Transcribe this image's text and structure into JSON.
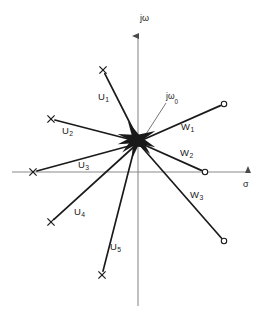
{
  "figure": {
    "width": 264,
    "height": 324,
    "background": "#ffffff",
    "ink_color": "#1a1a1a",
    "axis_color": "#8a8a8a"
  },
  "axes": {
    "origin": {
      "x": 138,
      "y": 172
    },
    "real": {
      "name": "sigma-axis",
      "label": "σ",
      "label_pos": {
        "x": 243,
        "y": 180
      },
      "x_start": 12,
      "x_end": 252,
      "y": 172,
      "arrow": "right"
    },
    "imaginary": {
      "name": "j-omega-axis",
      "label": "jω",
      "label_pos": {
        "x": 140,
        "y": 14
      },
      "y_start": 32,
      "y_end": 306,
      "x": 138,
      "arrow": "up"
    }
  },
  "annotations": [
    {
      "name": "j-omega-zero-annotation",
      "text": "jω",
      "sub": "0",
      "label_pos": {
        "x": 166,
        "y": 92
      },
      "leader_from": {
        "x": 166,
        "y": 103
      },
      "leader_to": {
        "x": 146,
        "y": 134
      }
    }
  ],
  "cluster": {
    "name": "origin-cluster",
    "center": {
      "x": 137,
      "y": 139
    },
    "description": "dense bundle of ray tails converging near the origin"
  },
  "rays": [
    {
      "name": "ray-u1",
      "label": "U",
      "sub": "1",
      "marker": "x",
      "marker_pos": {
        "x": 103,
        "y": 70
      },
      "tail": {
        "x": 140,
        "y": 143
      },
      "label_pos": {
        "x": 98,
        "y": 92
      }
    },
    {
      "name": "ray-u2",
      "label": "U",
      "sub": "2",
      "marker": "x",
      "marker_pos": {
        "x": 51,
        "y": 119
      },
      "tail": {
        "x": 140,
        "y": 142
      },
      "label_pos": {
        "x": 62,
        "y": 126
      }
    },
    {
      "name": "ray-u3",
      "label": "U",
      "sub": "3",
      "marker": "x",
      "marker_pos": {
        "x": 33,
        "y": 172
      },
      "tail": {
        "x": 140,
        "y": 143
      },
      "label_pos": {
        "x": 78,
        "y": 160
      }
    },
    {
      "name": "ray-u4",
      "label": "U",
      "sub": "4",
      "marker": "x",
      "marker_pos": {
        "x": 51,
        "y": 222
      },
      "tail": {
        "x": 138,
        "y": 143
      },
      "label_pos": {
        "x": 74,
        "y": 207
      }
    },
    {
      "name": "ray-u5",
      "label": "U",
      "sub": "5",
      "marker": "x",
      "marker_pos": {
        "x": 102,
        "y": 275
      },
      "tail": {
        "x": 136,
        "y": 142
      },
      "label_pos": {
        "x": 110,
        "y": 242
      }
    },
    {
      "name": "ray-w1",
      "label": "W",
      "sub": "1",
      "marker": "o",
      "marker_pos": {
        "x": 224,
        "y": 104
      },
      "tail": {
        "x": 140,
        "y": 141
      },
      "label_pos": {
        "x": 181,
        "y": 122
      }
    },
    {
      "name": "ray-w2",
      "label": "W",
      "sub": "2",
      "marker": "o",
      "marker_pos": {
        "x": 205,
        "y": 172
      },
      "tail": {
        "x": 140,
        "y": 143
      },
      "label_pos": {
        "x": 180,
        "y": 148
      }
    },
    {
      "name": "ray-w3",
      "label": "W",
      "sub": "3",
      "marker": "o",
      "marker_pos": {
        "x": 224,
        "y": 241
      },
      "tail": {
        "x": 140,
        "y": 145
      },
      "label_pos": {
        "x": 190,
        "y": 190
      }
    }
  ],
  "chart_data": {
    "type": "scatter",
    "title": "",
    "xlabel": "σ",
    "ylabel": "jω",
    "grid": false,
    "legend": null,
    "series": [
      {
        "name": "U (x markers)",
        "marker": "x",
        "points": [
          {
            "label": "U1",
            "x": -35,
            "y": 102
          },
          {
            "label": "U2",
            "x": -87,
            "y": 53
          },
          {
            "label": "U3",
            "x": -105,
            "y": 0
          },
          {
            "label": "U4",
            "x": -87,
            "y": -50
          },
          {
            "label": "U5",
            "x": -36,
            "y": -103
          }
        ]
      },
      {
        "name": "W (o markers)",
        "marker": "o",
        "points": [
          {
            "label": "W1",
            "x": 86,
            "y": 68
          },
          {
            "label": "W2",
            "x": 67,
            "y": 0
          },
          {
            "label": "W3",
            "x": 86,
            "y": -69
          }
        ]
      }
    ],
    "xlim": [
      -126,
      114
    ],
    "ylim": [
      -134,
      140
    ],
    "annotations": [
      "jω₀"
    ]
  }
}
